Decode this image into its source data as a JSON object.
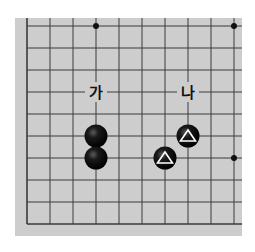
{
  "board": {
    "background_color": "#cdcdcd",
    "line_color": "#3a3a3a",
    "page_color": "#ffffff",
    "area": {
      "x": 15,
      "y": 18,
      "width": 227,
      "height": 218
    },
    "grid": {
      "x_lines": [
        27,
        50,
        73,
        96,
        119,
        142,
        165,
        188,
        211,
        234
      ],
      "y_lines": [
        26,
        48,
        70,
        92,
        114,
        136,
        158,
        180,
        202,
        224
      ],
      "left_edge_x": 27,
      "bottom_edge_y": 224
    },
    "star_points": [
      {
        "x": 96,
        "y": 26
      },
      {
        "x": 234,
        "y": 26
      },
      {
        "x": 234,
        "y": 158
      }
    ]
  },
  "stones": [
    {
      "color": "black",
      "x": 96,
      "y": 136,
      "marker": "none"
    },
    {
      "color": "black",
      "x": 96,
      "y": 158,
      "marker": "none"
    },
    {
      "color": "black",
      "x": 188,
      "y": 136,
      "marker": "triangle"
    },
    {
      "color": "black",
      "x": 165,
      "y": 158,
      "marker": "triangle"
    }
  ],
  "labels": [
    {
      "id": "ga",
      "text": "가",
      "x": 96,
      "y": 92
    },
    {
      "id": "na",
      "text": "나",
      "x": 188,
      "y": 92
    }
  ]
}
